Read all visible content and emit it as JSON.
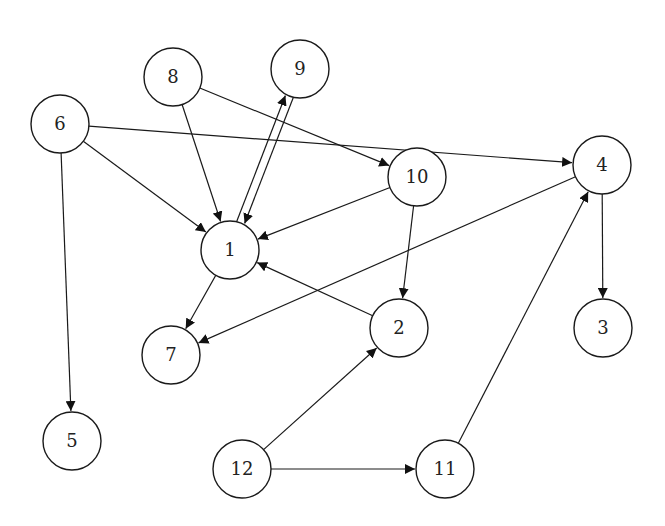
{
  "diagram": {
    "type": "directed-graph",
    "node_radius": 29,
    "colors": {
      "stroke": "#1a1a1a",
      "fill": "#ffffff",
      "text": "#222222",
      "background": "#ffffff"
    },
    "nodes": [
      {
        "id": "1",
        "label": "1",
        "x": 230,
        "y": 250
      },
      {
        "id": "2",
        "label": "2",
        "x": 399,
        "y": 328
      },
      {
        "id": "3",
        "label": "3",
        "x": 603,
        "y": 328
      },
      {
        "id": "4",
        "label": "4",
        "x": 602,
        "y": 165
      },
      {
        "id": "5",
        "label": "5",
        "x": 72,
        "y": 441
      },
      {
        "id": "6",
        "label": "6",
        "x": 60,
        "y": 124
      },
      {
        "id": "7",
        "label": "7",
        "x": 171,
        "y": 355
      },
      {
        "id": "8",
        "label": "8",
        "x": 173,
        "y": 77
      },
      {
        "id": "9",
        "label": "9",
        "x": 300,
        "y": 69
      },
      {
        "id": "10",
        "label": "10",
        "x": 417,
        "y": 177
      },
      {
        "id": "11",
        "label": "11",
        "x": 445,
        "y": 469
      },
      {
        "id": "12",
        "label": "12",
        "x": 242,
        "y": 469
      }
    ],
    "edges": [
      {
        "from": "6",
        "to": "4"
      },
      {
        "from": "6",
        "to": "1"
      },
      {
        "from": "6",
        "to": "5"
      },
      {
        "from": "8",
        "to": "1"
      },
      {
        "from": "8",
        "to": "10"
      },
      {
        "from": "1",
        "to": "9",
        "offset": -4
      },
      {
        "from": "9",
        "to": "1",
        "offset": -4
      },
      {
        "from": "10",
        "to": "1"
      },
      {
        "from": "10",
        "to": "2"
      },
      {
        "from": "2",
        "to": "1"
      },
      {
        "from": "4",
        "to": "7"
      },
      {
        "from": "4",
        "to": "3"
      },
      {
        "from": "1",
        "to": "7"
      },
      {
        "from": "12",
        "to": "2"
      },
      {
        "from": "12",
        "to": "11"
      },
      {
        "from": "11",
        "to": "4"
      }
    ]
  }
}
